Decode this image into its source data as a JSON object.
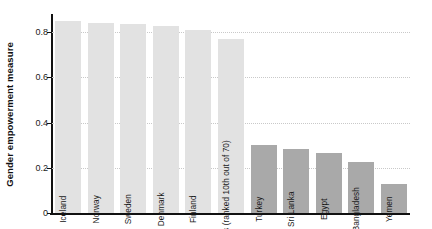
{
  "chart_data": {
    "type": "bar",
    "title": "",
    "xlabel": "",
    "ylabel": "Gender empowerment measure",
    "ylim": [
      0,
      0.88
    ],
    "grid": true,
    "legend": "none",
    "ytick_labels": [
      "0",
      "0.2",
      "0.4",
      "0.6",
      "0.8"
    ],
    "ytick_values": [
      0,
      0.2,
      0.4,
      0.6,
      0.8
    ],
    "categories": [
      "Iceland",
      "Norway",
      "Sweden",
      "Denmark",
      "Finland",
      "United States (ranked 10th out of 70)",
      "Turkey",
      "Sri Lanka",
      "Egypt",
      "Bangladesh",
      "Yemen"
    ],
    "values": [
      0.85,
      0.84,
      0.835,
      0.825,
      0.81,
      0.77,
      0.3,
      0.285,
      0.265,
      0.225,
      0.13
    ],
    "bar_colors": [
      "#e2e2e2",
      "#e2e2e2",
      "#e2e2e2",
      "#e2e2e2",
      "#e2e2e2",
      "#e2e2e2",
      "#a9a9a9",
      "#a9a9a9",
      "#a9a9a9",
      "#a9a9a9",
      "#a9a9a9"
    ],
    "colors": {
      "light_bar": "#e2e2e2",
      "dark_bar": "#a9a9a9",
      "axis": "#111111",
      "gridline": "#c9c9c9",
      "background": "#ffffff",
      "text": "#1a1a1a"
    }
  }
}
